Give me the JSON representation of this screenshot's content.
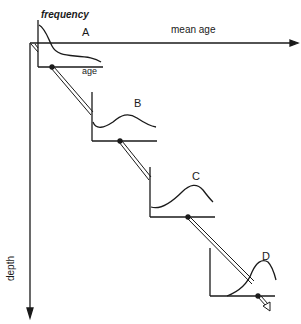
{
  "labels": {
    "frequency": "frequency",
    "age": "age",
    "mean_age": "mean age",
    "depth": "depth",
    "panel_a": "A",
    "panel_b": "B",
    "panel_c": "C",
    "panel_d": "D"
  },
  "colors": {
    "ink": "#1a1a1a",
    "background": "#ffffff"
  }
}
